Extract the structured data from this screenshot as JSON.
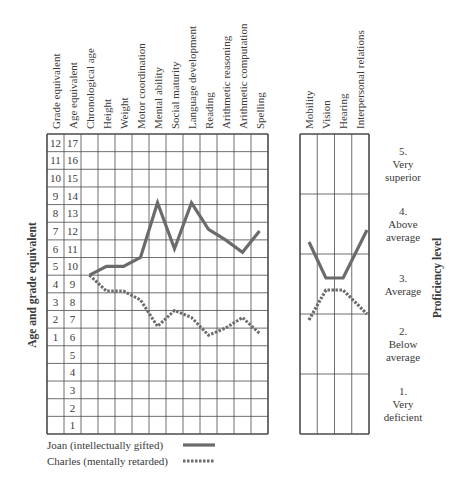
{
  "chart_data": [
    {
      "type": "line",
      "title": "",
      "ylabel": "Age and grade equivalent",
      "xlabel": "",
      "categories": [
        "Chronological age",
        "Height",
        "Weight",
        "Motor coordination",
        "Mental ability",
        "Social maturity",
        "Language development",
        "Reading",
        "Arithmetic reasoning",
        "Arithmetic computation",
        "Spelling"
      ],
      "row_label_columns": [
        "Grade equivalent",
        "Age equivalent"
      ],
      "age_ticks": [
        17,
        16,
        15,
        14,
        13,
        12,
        11,
        10,
        9,
        8,
        7,
        6,
        5,
        4,
        3,
        2,
        1
      ],
      "grade_ticks": [
        12,
        11,
        10,
        9,
        8,
        7,
        6,
        5,
        4,
        3,
        2,
        1,
        "",
        "",
        "",
        "",
        ""
      ],
      "ylim": [
        0.5,
        17.5
      ],
      "grid": true,
      "series": [
        {
          "name": "Joan (intellectually gifted)",
          "style": "solid",
          "values": [
            9.5,
            10.0,
            10.0,
            10.5,
            13.6,
            11.0,
            13.6,
            12.1,
            11.5,
            10.8,
            12.0
          ]
        },
        {
          "name": "Charles (mentally retarded)",
          "style": "dashed",
          "values": [
            9.5,
            8.6,
            8.6,
            8.1,
            6.6,
            7.5,
            7.1,
            6.1,
            6.5,
            7.1,
            6.2
          ]
        }
      ]
    },
    {
      "type": "line",
      "title": "",
      "ylabel": "Proficiency level",
      "categories": [
        "Mobility",
        "Vision",
        "Hearing",
        "Interpersonal relations"
      ],
      "ylim": [
        0,
        5
      ],
      "levels": [
        {
          "num": "5.",
          "line1": "Very",
          "line2": "superior"
        },
        {
          "num": "4.",
          "line1": "Above",
          "line2": "average"
        },
        {
          "num": "3.",
          "line1": "Average",
          "line2": ""
        },
        {
          "num": "2.",
          "line1": "Below",
          "line2": "average"
        },
        {
          "num": "1.",
          "line1": "Very",
          "line2": "deficient"
        }
      ],
      "series": [
        {
          "name": "Joan (intellectually gifted)",
          "style": "solid",
          "values": [
            3.2,
            2.6,
            2.6,
            3.4
          ]
        },
        {
          "name": "Charles (mentally retarded)",
          "style": "dashed",
          "values": [
            1.9,
            2.4,
            2.4,
            2.0
          ]
        }
      ]
    }
  ],
  "legend": [
    {
      "label": "Joan (intellectually gifted)",
      "style": "solid"
    },
    {
      "label": "Charles (mentally retarded)",
      "style": "dashed"
    }
  ],
  "colors": {
    "line": "#6b6b6b",
    "grid": "#4a4a4a",
    "text": "#3a3a3a"
  }
}
